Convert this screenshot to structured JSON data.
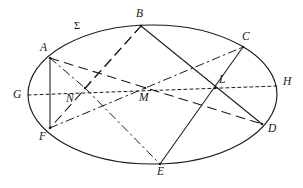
{
  "figure": {
    "kind": "geometry-diagram",
    "shape": "ellipse",
    "stroke_color": "#1b1b1b",
    "background_color": "#ffffff",
    "width": 303,
    "height": 188,
    "surface_label": "Σ",
    "ellipse": {
      "cx": 152.5,
      "cy": 94.5,
      "rx": 124.5,
      "ry": 69.5
    },
    "labels": {
      "A": "A",
      "B": "B",
      "C": "C",
      "D": "D",
      "E": "E",
      "F": "F",
      "G": "G",
      "H": "H",
      "L": "L",
      "M": "M",
      "N": "N",
      "sigma": "Σ"
    },
    "points": [
      {
        "id": "A",
        "label": "A",
        "x": 50,
        "y": 58,
        "label_x": 40,
        "label_y": 42,
        "on_ellipse": true
      },
      {
        "id": "B",
        "label": "B",
        "x": 141,
        "y": 26,
        "label_x": 136,
        "label_y": 8,
        "on_ellipse": true
      },
      {
        "id": "C",
        "label": "C",
        "x": 243,
        "y": 47,
        "label_x": 242,
        "label_y": 31,
        "on_ellipse": true
      },
      {
        "id": "D",
        "label": "D",
        "x": 262,
        "y": 124,
        "label_x": 268,
        "label_y": 123,
        "on_ellipse": true
      },
      {
        "id": "E",
        "label": "E",
        "x": 160,
        "y": 164,
        "label_x": 157,
        "label_y": 166,
        "on_ellipse": true
      },
      {
        "id": "F",
        "label": "F",
        "x": 50,
        "y": 128,
        "label_x": 39,
        "label_y": 131,
        "on_ellipse": true
      },
      {
        "id": "G",
        "label": "G",
        "x": 28,
        "y": 95,
        "label_x": 13,
        "label_y": 89,
        "on_ellipse": true
      },
      {
        "id": "H",
        "label": "H",
        "x": 277,
        "y": 86,
        "label_x": 283,
        "label_y": 76,
        "on_ellipse": true
      },
      {
        "id": "L",
        "label": "L",
        "x": 215,
        "y": 88,
        "label_x": 219,
        "label_y": 74,
        "on_ellipse": false
      },
      {
        "id": "M",
        "label": "M",
        "x": 145,
        "y": 88,
        "label_x": 139,
        "label_y": 92,
        "on_ellipse": false
      },
      {
        "id": "N",
        "label": "N",
        "x": 85,
        "y": 88,
        "label_x": 66,
        "label_y": 93,
        "on_ellipse": false
      }
    ],
    "sigma_label_pos": {
      "x": 74,
      "y": 21
    },
    "segments": [
      {
        "id": "A-F",
        "from": "A",
        "to": "F",
        "style": "solid",
        "name": "chord-a-f"
      },
      {
        "id": "B-D",
        "from": "B",
        "to": "D",
        "style": "solid",
        "name": "chord-b-d"
      },
      {
        "id": "C-E",
        "from": "C",
        "to": "E",
        "style": "solid",
        "name": "chord-c-e"
      },
      {
        "id": "G-H",
        "from": "G",
        "to": "H",
        "style": "dotted",
        "name": "axis-g-h"
      },
      {
        "id": "A-D",
        "from": "A",
        "to": "D",
        "style": "dashed",
        "name": "chord-a-d"
      },
      {
        "id": "B-F",
        "from": "B",
        "to": "F",
        "style": "dashed",
        "name": "chord-b-f"
      },
      {
        "id": "B-N",
        "from": "B",
        "to": "N",
        "style": "dashed",
        "name": "chord-b-n"
      },
      {
        "id": "F-C",
        "from": "F",
        "to": "C",
        "style": "dashdot",
        "name": "chord-f-c"
      },
      {
        "id": "N-E",
        "from": "N",
        "to": "E",
        "style": "dashdot",
        "name": "chord-n-e"
      },
      {
        "id": "A-N",
        "from": "A",
        "to": "N",
        "style": "dashdot",
        "name": "chord-a-n"
      },
      {
        "id": "N-M",
        "from": "N",
        "to": "M",
        "style": "dotted",
        "name": "segment-n-m"
      }
    ]
  }
}
